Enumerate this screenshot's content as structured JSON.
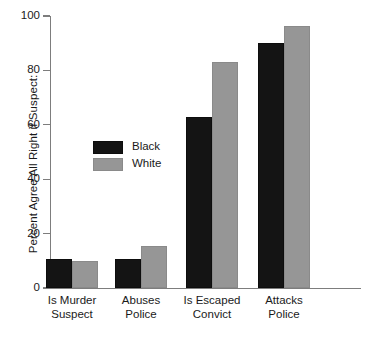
{
  "chart_data": {
    "type": "bar",
    "title": "",
    "subtitle": "",
    "xlabel": "",
    "ylabel": "Percent Agree All Right if Suspect:",
    "ylim": [
      0,
      100
    ],
    "yticks": [
      0,
      20,
      40,
      60,
      80,
      100
    ],
    "ytick_labels": [
      "0",
      "20",
      "40",
      "60",
      "80",
      "100"
    ],
    "grid": false,
    "legend_position": "inside-upper-left",
    "categories": [
      "Is Murder Suspect",
      "Abuses Police",
      "Is Escaped Convict",
      "Attacks Police"
    ],
    "category_lines": [
      [
        "Is Murder",
        "Suspect"
      ],
      [
        "Abuses",
        "Police"
      ],
      [
        "Is Escaped",
        "Convict"
      ],
      [
        "Attacks",
        "Police"
      ]
    ],
    "series": [
      {
        "name": "Black",
        "color": "#141414",
        "values": [
          10.5,
          10.5,
          63,
          90
        ]
      },
      {
        "name": "White",
        "color": "#969696",
        "values": [
          10,
          15.5,
          83,
          96.5
        ]
      }
    ]
  },
  "colors": {
    "series_black": "#141414",
    "series_white": "#969696",
    "axis": "#7d7d7d",
    "text": "#1a1a1a",
    "background": "#ffffff"
  }
}
